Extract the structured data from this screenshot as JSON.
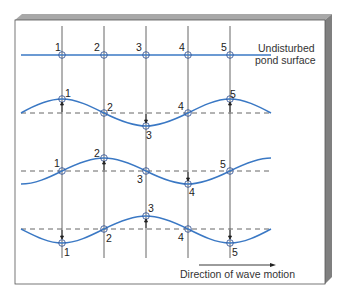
{
  "diagram": {
    "undisturbed_label_line1": "Undisturbed",
    "undisturbed_label_line2": "pond surface",
    "direction_label": "Direction of wave motion",
    "point_labels": [
      "1",
      "2",
      "3",
      "4",
      "5"
    ],
    "colors": {
      "wave": "#3a78c4",
      "frame_face": "#ffffff",
      "frame_top": "#9a9a9a",
      "frame_side": "#7d7d7d",
      "lines": "#444444"
    },
    "rows": [
      {
        "name": "undisturbed",
        "displacements": [
          0,
          0,
          0,
          0,
          0
        ]
      },
      {
        "name": "stage-1",
        "displacements": [
          1,
          0,
          -1,
          0,
          1
        ]
      },
      {
        "name": "stage-2",
        "displacements": [
          0,
          1,
          0,
          -1,
          0
        ]
      },
      {
        "name": "stage-3",
        "displacements": [
          -1,
          0,
          1,
          0,
          -1
        ]
      }
    ]
  }
}
